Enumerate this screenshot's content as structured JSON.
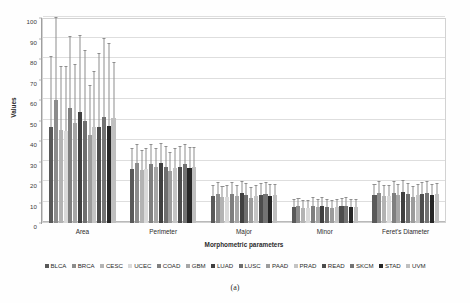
{
  "caption": "(a)",
  "chart_data": {
    "type": "bar",
    "title": "",
    "xlabel": "Morphometric parameters",
    "ylabel": "Values",
    "ylim": [
      0,
      100
    ],
    "ytick_step": 10,
    "yticks": [
      "0",
      "10",
      "20",
      "30",
      "40",
      "50",
      "60",
      "70",
      "80",
      "90",
      "100"
    ],
    "grid": true,
    "legend_position": "bottom",
    "error_bars": true,
    "categories": [
      "Area",
      "Perimeter",
      "Major",
      "Minor",
      "Feret's Diameter"
    ],
    "series": [
      {
        "name": "BLCA",
        "color": "#595959",
        "values": [
          47.0,
          26.5,
          13.0,
          8.0,
          13.5
        ],
        "errors": [
          34.0,
          9.5,
          5.0,
          3.0,
          5.0
        ]
      },
      {
        "name": "BRCA",
        "color": "#8c8c8c",
        "values": [
          60.0,
          29.5,
          14.0,
          8.5,
          14.5
        ],
        "errors": [
          40.0,
          8.5,
          5.5,
          3.0,
          5.5
        ]
      },
      {
        "name": "CESC",
        "color": "#b3b3b3",
        "values": [
          45.5,
          26.0,
          12.5,
          7.5,
          13.0
        ],
        "errors": [
          30.5,
          9.0,
          5.0,
          3.0,
          5.0
        ]
      },
      {
        "name": "UCEC",
        "color": "#d9d9d9",
        "values": [
          45.0,
          26.5,
          12.5,
          7.5,
          13.0
        ],
        "errors": [
          31.0,
          9.5,
          5.5,
          3.0,
          5.0
        ]
      },
      {
        "name": "COAD",
        "color": "#7f7f7f",
        "values": [
          56.0,
          29.0,
          14.0,
          8.5,
          14.5
        ],
        "errors": [
          34.5,
          9.0,
          5.5,
          3.5,
          5.5
        ]
      },
      {
        "name": "GBM",
        "color": "#a6a6a6",
        "values": [
          49.0,
          27.5,
          13.0,
          8.0,
          13.5
        ],
        "errors": [
          28.0,
          8.5,
          5.0,
          3.0,
          5.0
        ]
      },
      {
        "name": "LUAD",
        "color": "#404040",
        "values": [
          54.0,
          29.5,
          14.5,
          8.5,
          15.0
        ],
        "errors": [
          37.0,
          9.0,
          5.5,
          3.5,
          5.5
        ]
      },
      {
        "name": "LUSC",
        "color": "#6e6e6e",
        "values": [
          50.0,
          27.5,
          13.5,
          8.0,
          14.0
        ],
        "errors": [
          34.0,
          9.5,
          5.5,
          3.0,
          5.0
        ]
      },
      {
        "name": "PAAD",
        "color": "#9c9c9c",
        "values": [
          43.0,
          25.5,
          12.0,
          7.5,
          12.5
        ],
        "errors": [
          24.0,
          8.5,
          5.0,
          3.0,
          5.0
        ]
      },
      {
        "name": "PRAD",
        "color": "#c4c4c4",
        "values": [
          47.0,
          27.0,
          13.0,
          8.0,
          13.5
        ],
        "errors": [
          26.5,
          9.0,
          5.0,
          3.0,
          5.0
        ]
      },
      {
        "name": "READ",
        "color": "#4d4d4d",
        "values": [
          47.0,
          27.5,
          13.5,
          8.5,
          14.0
        ],
        "errors": [
          35.5,
          9.5,
          5.5,
          3.0,
          5.5
        ]
      },
      {
        "name": "SKCM",
        "color": "#737373",
        "values": [
          51.5,
          29.0,
          14.0,
          8.5,
          14.5
        ],
        "errors": [
          38.5,
          9.0,
          5.5,
          3.5,
          5.5
        ]
      },
      {
        "name": "STAD",
        "color": "#262626",
        "values": [
          47.5,
          27.0,
          13.0,
          8.0,
          13.5
        ],
        "errors": [
          40.0,
          9.5,
          5.5,
          3.0,
          5.0
        ]
      },
      {
        "name": "UVM",
        "color": "#bfbfbf",
        "values": [
          51.0,
          27.5,
          13.5,
          8.0,
          14.0
        ],
        "errors": [
          27.0,
          9.0,
          5.0,
          3.0,
          5.0
        ]
      }
    ]
  }
}
